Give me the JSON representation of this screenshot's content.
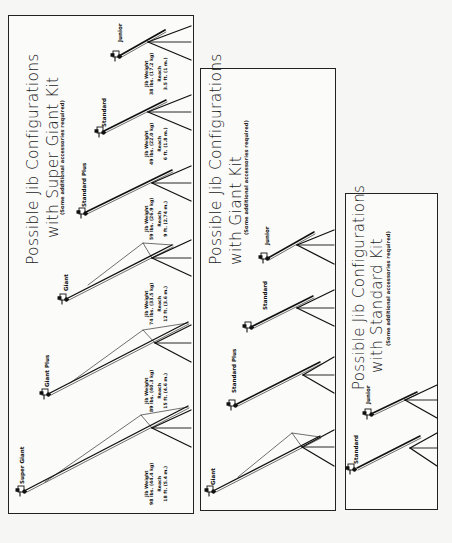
{
  "panels": [
    {
      "id": "super-giant-kit",
      "title_line1": "Possible Jib Configurations",
      "title_line2": "with Super Giant Kit",
      "note": "(Some additional accessories required)",
      "jibs": [
        {
          "name": "Junior",
          "weight_label": "Jib Weight",
          "weight": "38 lbs. (17.2 kg)",
          "reach_label": "Reach",
          "reach": "3.5 ft. (1 m.)"
        },
        {
          "name": "Standard",
          "weight_label": "Jib Weight",
          "weight": "49 lbs. (22.0 kg)",
          "reach_label": "Reach",
          "reach": "6 ft. (1.8 m.)"
        },
        {
          "name": "Standard Plus",
          "weight_label": "Jib Weight",
          "weight": "59 lbs. (26.9 kg)",
          "reach_label": "Reach",
          "reach": "9 ft. (2.74 m.)"
        },
        {
          "name": "Giant",
          "weight_label": "Jib Weight",
          "weight": "74 lbs. (33.5 kg)",
          "reach_label": "Reach",
          "reach": "12 ft. (3.6 m.)"
        },
        {
          "name": "Giant Plus",
          "weight_label": "Jib Weight",
          "weight": "89 lbs. (40.3 kg)",
          "reach_label": "Reach",
          "reach": "15 ft. (4.6 m.)"
        },
        {
          "name": "Super Giant",
          "weight_label": "Jib Weight",
          "weight": "98 lbs. (44.4 kg)",
          "reach_label": "Reach",
          "reach": "18 ft. (5.4 m.)"
        }
      ]
    },
    {
      "id": "giant-kit",
      "title_line1": "Possible Jib Configurations",
      "title_line2": "with Giant Kit",
      "note": "(Some additional accessories required)",
      "jibs": [
        {
          "name": "Junior"
        },
        {
          "name": "Standard"
        },
        {
          "name": "Standard Plus"
        },
        {
          "name": "Giant"
        }
      ]
    },
    {
      "id": "standard-kit",
      "title_line1": "Possible Jib Configurations",
      "title_line2": "with Standard Kit",
      "note": "(Some additional accessories required)",
      "jibs": [
        {
          "name": "Junior"
        },
        {
          "name": "Standard"
        }
      ]
    }
  ]
}
